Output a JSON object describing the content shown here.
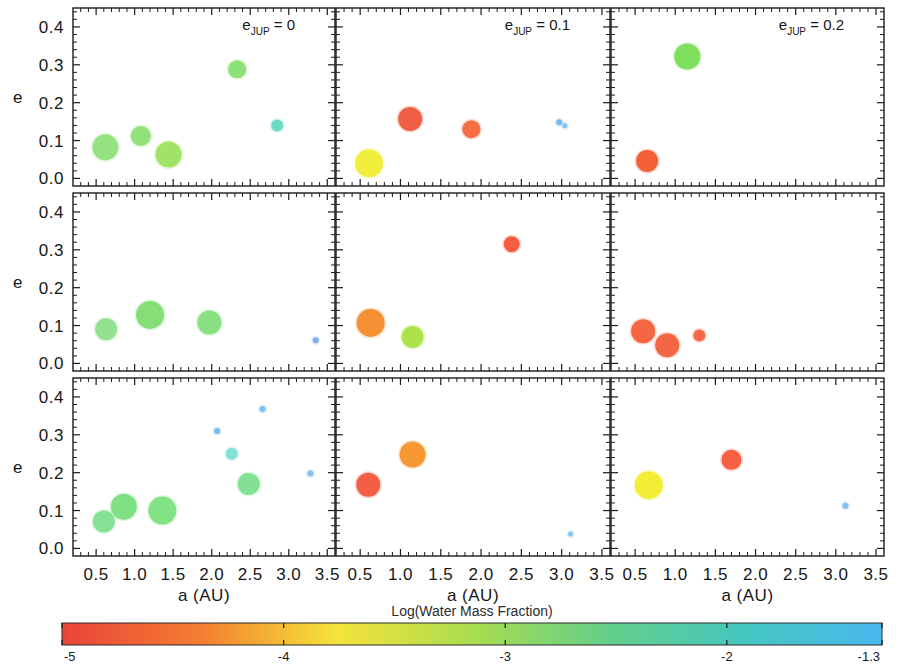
{
  "figure": {
    "axis_labels": {
      "x": "a (AU)",
      "y": "e"
    },
    "x_ticks": [
      "0.5",
      "1.0",
      "1.5",
      "2.0",
      "2.5",
      "3.0",
      "3.5"
    ],
    "x_tick_values": [
      0.5,
      1.0,
      1.5,
      2.0,
      2.5,
      3.0,
      3.5
    ],
    "y_ticks": [
      "0.0",
      "0.1",
      "0.2",
      "0.3",
      "0.4"
    ],
    "y_tick_values": [
      0.0,
      0.1,
      0.2,
      0.3,
      0.4
    ],
    "column_annotations": [
      {
        "base": "e",
        "sub": "JUP",
        "rest": "=  0"
      },
      {
        "base": "e",
        "sub": "JUP",
        "rest": "=  0.1"
      },
      {
        "base": "e",
        "sub": "JUP",
        "rest": "=  0.2"
      }
    ],
    "colorbar": {
      "title": "Log(Water Mass Fraction)",
      "tick_labels": [
        "-5",
        "-4",
        "-3",
        "-2",
        "-1.3"
      ],
      "tick_values": [
        -5,
        -4,
        -3,
        -2,
        -1.3
      ],
      "min": -5,
      "max": -1.3,
      "stops": [
        "#e8443a",
        "#f47c30",
        "#f6e33a",
        "#a9dd4e",
        "#63cf8a",
        "#45c7c0",
        "#49b8ef"
      ]
    }
  },
  "chart_data": {
    "type": "scatter",
    "title": "",
    "xlabel": "a (AU)",
    "ylabel": "e",
    "xlim": [
      0.2,
      3.6
    ],
    "ylim": [
      -0.02,
      0.45
    ],
    "grid": false,
    "legend": "colorbar",
    "colorbar_label": "Log(Water Mass Fraction)",
    "colorbar_range": [
      -5,
      -1.3
    ],
    "size_encodes": "planet mass",
    "panels": [
      {
        "row": 0,
        "col": 0,
        "annotation": "e_JUP = 0",
        "points": [
          {
            "a": 0.62,
            "e": 0.082,
            "r": 13,
            "color": "#8fe07a",
            "wmf": -2.55
          },
          {
            "a": 1.08,
            "e": 0.112,
            "r": 10,
            "color": "#8ede76",
            "wmf": -2.6
          },
          {
            "a": 1.44,
            "e": 0.063,
            "r": 13,
            "color": "#9ce15f",
            "wmf": -2.75
          },
          {
            "a": 2.33,
            "e": 0.288,
            "r": 9,
            "color": "#88e06f",
            "wmf": -2.6
          },
          {
            "a": 2.85,
            "e": 0.14,
            "r": 6,
            "color": "#66d9c0",
            "wmf": -1.95
          }
        ]
      },
      {
        "row": 0,
        "col": 1,
        "annotation": "e_JUP = 0.1",
        "points": [
          {
            "a": 0.61,
            "e": 0.04,
            "r": 14,
            "color": "#f1ed36",
            "wmf": -3.3
          },
          {
            "a": 1.12,
            "e": 0.157,
            "r": 12,
            "color": "#f05a3c",
            "wmf": -4.7
          },
          {
            "a": 1.88,
            "e": 0.13,
            "r": 9,
            "color": "#f4663a",
            "wmf": -4.6
          },
          {
            "a": 2.97,
            "e": 0.148,
            "r": 3,
            "color": "#6fb6ee",
            "wmf": -1.45
          },
          {
            "a": 3.04,
            "e": 0.139,
            "r": 2.5,
            "color": "#7fc0ef",
            "wmf": -1.4
          }
        ]
      },
      {
        "row": 0,
        "col": 2,
        "annotation": "e_JUP = 0.2",
        "points": [
          {
            "a": 1.15,
            "e": 0.322,
            "r": 13,
            "color": "#77dd55",
            "wmf": -2.8
          },
          {
            "a": 0.65,
            "e": 0.046,
            "r": 11,
            "color": "#f4592f",
            "wmf": -4.75
          }
        ]
      },
      {
        "row": 1,
        "col": 0,
        "annotation": "e_JUP = 0",
        "points": [
          {
            "a": 0.63,
            "e": 0.09,
            "r": 11,
            "color": "#8fe08c",
            "wmf": -2.4
          },
          {
            "a": 1.2,
            "e": 0.128,
            "r": 14,
            "color": "#7fdd70",
            "wmf": -2.55
          },
          {
            "a": 1.97,
            "e": 0.108,
            "r": 12,
            "color": "#83de7c",
            "wmf": -2.5
          },
          {
            "a": 3.35,
            "e": 0.061,
            "r": 3,
            "color": "#7fa8ea",
            "wmf": -1.35
          }
        ]
      },
      {
        "row": 1,
        "col": 1,
        "annotation": "e_JUP = 0.1",
        "points": [
          {
            "a": 0.63,
            "e": 0.107,
            "r": 14,
            "color": "#f58b2c",
            "wmf": -4.15
          },
          {
            "a": 1.15,
            "e": 0.07,
            "r": 11,
            "color": "#a9e243",
            "wmf": -2.95
          },
          {
            "a": 2.38,
            "e": 0.315,
            "r": 8,
            "color": "#f4553a",
            "wmf": -4.8
          }
        ]
      },
      {
        "row": 1,
        "col": 2,
        "annotation": "e_JUP = 0.2",
        "points": [
          {
            "a": 0.6,
            "e": 0.085,
            "r": 12,
            "color": "#f4603c",
            "wmf": -4.65
          },
          {
            "a": 0.9,
            "e": 0.048,
            "r": 12,
            "color": "#f4603c",
            "wmf": -4.65
          },
          {
            "a": 1.3,
            "e": 0.074,
            "r": 6,
            "color": "#f46240",
            "wmf": -4.6
          }
        ]
      },
      {
        "row": 2,
        "col": 0,
        "annotation": "e_JUP = 0",
        "points": [
          {
            "a": 0.6,
            "e": 0.071,
            "r": 11,
            "color": "#7ee08f",
            "wmf": -2.35
          },
          {
            "a": 0.86,
            "e": 0.11,
            "r": 13,
            "color": "#7adf7e",
            "wmf": -2.45
          },
          {
            "a": 1.36,
            "e": 0.1,
            "r": 14,
            "color": "#7ce080",
            "wmf": -2.45
          },
          {
            "a": 2.07,
            "e": 0.31,
            "r": 3,
            "color": "#72b8ee",
            "wmf": -1.5
          },
          {
            "a": 2.26,
            "e": 0.25,
            "r": 6,
            "color": "#7fdfd5",
            "wmf": -1.8
          },
          {
            "a": 2.48,
            "e": 0.17,
            "r": 11,
            "color": "#7ddf8e",
            "wmf": -2.35
          },
          {
            "a": 2.66,
            "e": 0.368,
            "r": 3,
            "color": "#76bbee",
            "wmf": -1.5
          },
          {
            "a": 3.28,
            "e": 0.198,
            "r": 3,
            "color": "#7fbdee",
            "wmf": -1.45
          }
        ]
      },
      {
        "row": 2,
        "col": 1,
        "annotation": "e_JUP = 0.1",
        "points": [
          {
            "a": 0.6,
            "e": 0.168,
            "r": 12,
            "color": "#f3563e",
            "wmf": -4.8
          },
          {
            "a": 1.15,
            "e": 0.248,
            "r": 13,
            "color": "#f6952c",
            "wmf": -4.0
          },
          {
            "a": 3.11,
            "e": 0.038,
            "r": 2.5,
            "color": "#7fc5ee",
            "wmf": -1.4
          }
        ]
      },
      {
        "row": 2,
        "col": 2,
        "annotation": "e_JUP = 0.2",
        "points": [
          {
            "a": 0.67,
            "e": 0.167,
            "r": 14,
            "color": "#f3ec2c",
            "wmf": -3.35
          },
          {
            "a": 1.7,
            "e": 0.234,
            "r": 10,
            "color": "#f4593a",
            "wmf": -4.8
          },
          {
            "a": 3.12,
            "e": 0.113,
            "r": 3,
            "color": "#7fbcee",
            "wmf": -1.45
          }
        ]
      }
    ]
  }
}
